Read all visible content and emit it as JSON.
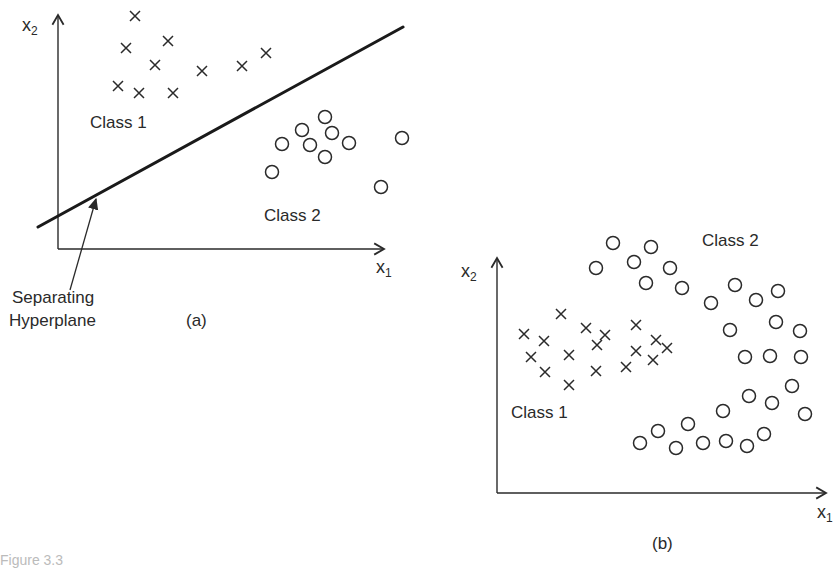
{
  "panel_a": {
    "label": "(a)",
    "x_axis": {
      "name": "x",
      "sub": "1"
    },
    "y_axis": {
      "name": "x",
      "sub": "2"
    },
    "class1_label": "Class 1",
    "class2_label": "Class 2",
    "annotation": {
      "line1": "Separating",
      "line2": "Hyperplane"
    },
    "hyperplane": {
      "x1": 38,
      "y1": 227,
      "x2": 403,
      "y2": 27
    },
    "class1_crosses": [
      [
        135,
        16
      ],
      [
        126,
        48
      ],
      [
        168,
        41
      ],
      [
        155,
        65
      ],
      [
        202,
        71
      ],
      [
        242,
        66
      ],
      [
        266,
        53
      ],
      [
        118,
        86
      ],
      [
        139,
        93
      ],
      [
        173,
        93
      ]
    ],
    "class2_circles": [
      [
        325,
        117
      ],
      [
        302,
        130
      ],
      [
        332,
        133
      ],
      [
        282,
        144
      ],
      [
        310,
        145
      ],
      [
        349,
        143
      ],
      [
        402,
        138
      ],
      [
        325,
        157
      ],
      [
        272,
        172
      ],
      [
        381,
        187
      ]
    ]
  },
  "panel_b": {
    "label": "(b)",
    "x_axis": {
      "name": "x",
      "sub": "1"
    },
    "y_axis": {
      "name": "x",
      "sub": "2"
    },
    "class1_label": "Class 1",
    "class2_label": "Class 2",
    "class1_crosses": [
      [
        561,
        314
      ],
      [
        524,
        334
      ],
      [
        544,
        341
      ],
      [
        586,
        328
      ],
      [
        605,
        335
      ],
      [
        597,
        345
      ],
      [
        531,
        357
      ],
      [
        569,
        355
      ],
      [
        636,
        325
      ],
      [
        656,
        340
      ],
      [
        667,
        348
      ],
      [
        545,
        372
      ],
      [
        596,
        371
      ],
      [
        626,
        367
      ],
      [
        636,
        351
      ],
      [
        653,
        360
      ],
      [
        569,
        385
      ]
    ],
    "class2_circles": [
      [
        613,
        243
      ],
      [
        651,
        247
      ],
      [
        596,
        268
      ],
      [
        634,
        262
      ],
      [
        670,
        268
      ],
      [
        646,
        283
      ],
      [
        682,
        288
      ],
      [
        735,
        285
      ],
      [
        711,
        303
      ],
      [
        756,
        300
      ],
      [
        778,
        291
      ],
      [
        730,
        330
      ],
      [
        776,
        322
      ],
      [
        800,
        331
      ],
      [
        745,
        357
      ],
      [
        770,
        356
      ],
      [
        801,
        357
      ],
      [
        792,
        386
      ],
      [
        749,
        396
      ],
      [
        772,
        403
      ],
      [
        723,
        411
      ],
      [
        805,
        414
      ],
      [
        688,
        424
      ],
      [
        658,
        431
      ],
      [
        640,
        443
      ],
      [
        676,
        448
      ],
      [
        703,
        443
      ],
      [
        726,
        441
      ],
      [
        764,
        434
      ],
      [
        747,
        446
      ]
    ]
  },
  "caption": "Figure 3.3",
  "colors": {
    "ink": "#2a2a2a",
    "background": "#ffffff"
  }
}
